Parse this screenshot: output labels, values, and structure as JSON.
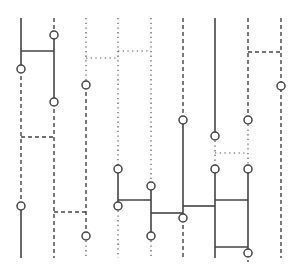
{
  "diagram": {
    "type": "braid-ladder",
    "columns": 9,
    "column_x": [
      21,
      54,
      86,
      118,
      151,
      183,
      215,
      248,
      281
    ],
    "line_color": "#444444",
    "node_fill": "#ffffff",
    "segments": [
      {
        "x1": 21,
        "y1": 18,
        "x2": 21,
        "y2": 69,
        "style": "solid"
      },
      {
        "x1": 21,
        "y1": 69,
        "x2": 21,
        "y2": 206,
        "style": "dashed"
      },
      {
        "x1": 21,
        "y1": 206,
        "x2": 21,
        "y2": 258,
        "style": "solid"
      },
      {
        "x1": 54,
        "y1": 18,
        "x2": 54,
        "y2": 35,
        "style": "dashed"
      },
      {
        "x1": 54,
        "y1": 35,
        "x2": 54,
        "y2": 102,
        "style": "solid"
      },
      {
        "x1": 54,
        "y1": 102,
        "x2": 54,
        "y2": 258,
        "style": "dashed"
      },
      {
        "x1": 86,
        "y1": 18,
        "x2": 86,
        "y2": 85,
        "style": "dotted"
      },
      {
        "x1": 86,
        "y1": 85,
        "x2": 86,
        "y2": 236,
        "style": "dashed"
      },
      {
        "x1": 86,
        "y1": 236,
        "x2": 86,
        "y2": 258,
        "style": "dotted"
      },
      {
        "x1": 118,
        "y1": 18,
        "x2": 118,
        "y2": 169,
        "style": "dotted"
      },
      {
        "x1": 118,
        "y1": 169,
        "x2": 118,
        "y2": 206,
        "style": "solid"
      },
      {
        "x1": 118,
        "y1": 206,
        "x2": 118,
        "y2": 258,
        "style": "dotted"
      },
      {
        "x1": 151,
        "y1": 18,
        "x2": 151,
        "y2": 186,
        "style": "dotted"
      },
      {
        "x1": 151,
        "y1": 186,
        "x2": 151,
        "y2": 236,
        "style": "solid"
      },
      {
        "x1": 151,
        "y1": 236,
        "x2": 151,
        "y2": 258,
        "style": "dotted"
      },
      {
        "x1": 183,
        "y1": 18,
        "x2": 183,
        "y2": 120,
        "style": "dashed"
      },
      {
        "x1": 183,
        "y1": 120,
        "x2": 183,
        "y2": 218,
        "style": "solid"
      },
      {
        "x1": 183,
        "y1": 218,
        "x2": 183,
        "y2": 258,
        "style": "dashed"
      },
      {
        "x1": 215,
        "y1": 18,
        "x2": 215,
        "y2": 136,
        "style": "solid"
      },
      {
        "x1": 215,
        "y1": 136,
        "x2": 215,
        "y2": 169,
        "style": "dotted"
      },
      {
        "x1": 215,
        "y1": 169,
        "x2": 215,
        "y2": 258,
        "style": "solid"
      },
      {
        "x1": 248,
        "y1": 18,
        "x2": 248,
        "y2": 120,
        "style": "dashed"
      },
      {
        "x1": 248,
        "y1": 120,
        "x2": 248,
        "y2": 169,
        "style": "dotted"
      },
      {
        "x1": 248,
        "y1": 169,
        "x2": 248,
        "y2": 253,
        "style": "solid"
      },
      {
        "x1": 248,
        "y1": 253,
        "x2": 248,
        "y2": 262,
        "style": "dashed"
      },
      {
        "x1": 281,
        "y1": 18,
        "x2": 281,
        "y2": 258,
        "style": "dashed"
      },
      {
        "x1": 21,
        "y1": 51,
        "x2": 54,
        "y2": 51,
        "style": "solid"
      },
      {
        "x1": 21,
        "y1": 137,
        "x2": 54,
        "y2": 137,
        "style": "dashed"
      },
      {
        "x1": 54,
        "y1": 212,
        "x2": 86,
        "y2": 212,
        "style": "dashed"
      },
      {
        "x1": 86,
        "y1": 58,
        "x2": 118,
        "y2": 58,
        "style": "dotted"
      },
      {
        "x1": 118,
        "y1": 51,
        "x2": 151,
        "y2": 51,
        "style": "dotted"
      },
      {
        "x1": 118,
        "y1": 200,
        "x2": 151,
        "y2": 200,
        "style": "solid"
      },
      {
        "x1": 151,
        "y1": 213,
        "x2": 183,
        "y2": 213,
        "style": "solid"
      },
      {
        "x1": 183,
        "y1": 206,
        "x2": 215,
        "y2": 206,
        "style": "solid"
      },
      {
        "x1": 215,
        "y1": 153,
        "x2": 248,
        "y2": 153,
        "style": "dotted"
      },
      {
        "x1": 215,
        "y1": 200,
        "x2": 248,
        "y2": 200,
        "style": "solid"
      },
      {
        "x1": 215,
        "y1": 247,
        "x2": 248,
        "y2": 247,
        "style": "solid"
      },
      {
        "x1": 248,
        "y1": 52,
        "x2": 281,
        "y2": 52,
        "style": "dashed"
      }
    ],
    "nodes": [
      {
        "x": 21,
        "y": 69
      },
      {
        "x": 21,
        "y": 206
      },
      {
        "x": 54,
        "y": 35
      },
      {
        "x": 54,
        "y": 102
      },
      {
        "x": 86,
        "y": 85
      },
      {
        "x": 86,
        "y": 236
      },
      {
        "x": 118,
        "y": 169
      },
      {
        "x": 118,
        "y": 206
      },
      {
        "x": 151,
        "y": 186
      },
      {
        "x": 151,
        "y": 236
      },
      {
        "x": 183,
        "y": 120
      },
      {
        "x": 183,
        "y": 218
      },
      {
        "x": 215,
        "y": 136
      },
      {
        "x": 215,
        "y": 169
      },
      {
        "x": 248,
        "y": 120
      },
      {
        "x": 248,
        "y": 169
      },
      {
        "x": 248,
        "y": 253
      },
      {
        "x": 281,
        "y": 86
      }
    ],
    "node_radius": 4
  }
}
